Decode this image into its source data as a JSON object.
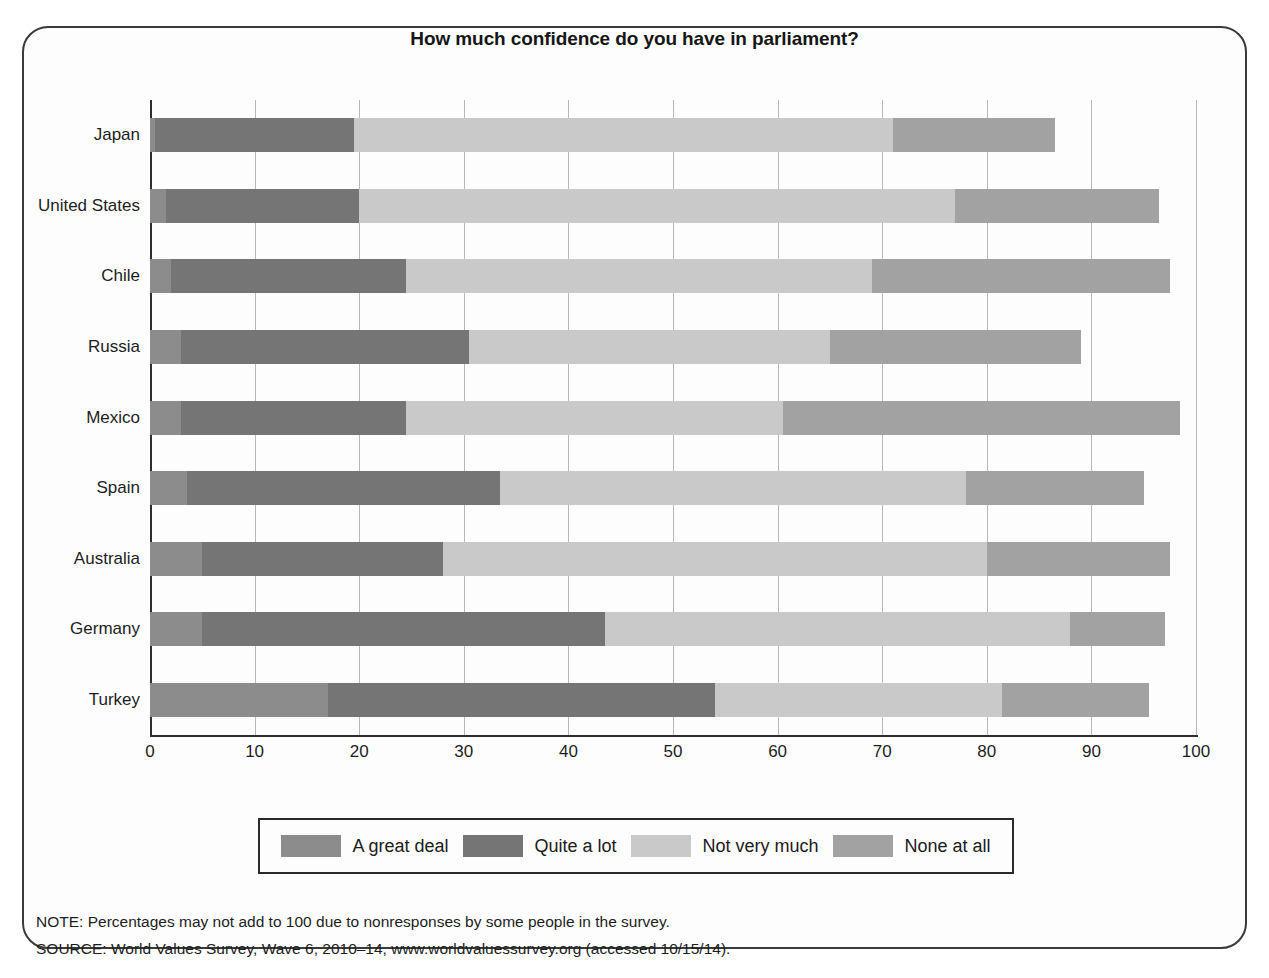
{
  "figure": {
    "title": "How much confidence do you have in parliament?"
  },
  "legend": {
    "items": [
      {
        "label": "A great deal",
        "color": "#8c8c8c"
      },
      {
        "label": "Quite a lot",
        "color": "#757575"
      },
      {
        "label": "Not very much",
        "color": "#c9c9c9"
      },
      {
        "label": "None at all",
        "color": "#a2a2a2"
      }
    ]
  },
  "footer": {
    "note": "NOTE: Percentages may not add to 100 due to nonresponses by some people in the survey.",
    "source": "SOURCE: World Values Survey, Wave 6, 2010–14, www.worldvaluessurvey.org (accessed 10/15/14)."
  },
  "chart_data": {
    "type": "bar",
    "orientation": "horizontal",
    "stacked": true,
    "title": "How much confidence do you have in parliament?",
    "xlabel": "",
    "ylabel": "",
    "xlim": [
      0,
      100
    ],
    "xticks": [
      0,
      10,
      20,
      30,
      40,
      50,
      60,
      70,
      80,
      90,
      100
    ],
    "grid": true,
    "legend_position": "bottom",
    "categories": [
      "Japan",
      "United States",
      "Chile",
      "Russia",
      "Mexico",
      "Spain",
      "Australia",
      "Germany",
      "Turkey"
    ],
    "series": [
      {
        "name": "A great deal",
        "color": "#8c8c8c",
        "values": [
          0.5,
          1.5,
          2.0,
          3.0,
          3.0,
          3.5,
          5.0,
          5.0,
          17.0
        ]
      },
      {
        "name": "Quite a lot",
        "color": "#757575",
        "values": [
          19.0,
          18.5,
          22.5,
          27.5,
          21.5,
          30.0,
          23.0,
          38.5,
          37.0
        ]
      },
      {
        "name": "Not very much",
        "color": "#c9c9c9",
        "values": [
          51.5,
          57.0,
          44.5,
          34.5,
          36.0,
          44.5,
          52.0,
          44.5,
          27.5
        ]
      },
      {
        "name": "None at all",
        "color": "#a2a2a2",
        "values": [
          15.5,
          19.5,
          28.5,
          24.0,
          38.0,
          17.0,
          17.5,
          9.0,
          14.0
        ]
      }
    ],
    "cumulative_ends": [
      [
        0.5,
        19.5,
        71.0,
        86.5
      ],
      [
        1.5,
        20.0,
        77.0,
        96.5
      ],
      [
        2.0,
        24.5,
        69.0,
        97.5
      ],
      [
        3.0,
        30.5,
        65.0,
        89.0
      ],
      [
        3.0,
        24.5,
        60.5,
        98.5
      ],
      [
        3.5,
        33.5,
        78.0,
        95.0
      ],
      [
        5.0,
        28.0,
        80.0,
        97.5
      ],
      [
        5.0,
        43.5,
        88.0,
        97.0
      ],
      [
        17.0,
        54.0,
        81.5,
        95.5
      ]
    ]
  }
}
